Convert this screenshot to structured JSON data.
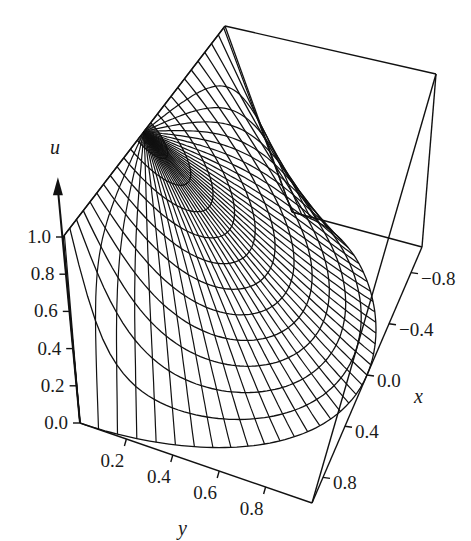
{
  "chart_data": {
    "type": "surface-wireframe",
    "title": "",
    "function": "u = (2/pi) * atan((1 - rho^2) / (2 * rho * sin(theta)))",
    "mesh": {
      "rho_rings": 12,
      "theta_rays": 40,
      "rho_max": 1.0
    },
    "axes": {
      "u": {
        "label": "u",
        "range": [
          0.0,
          1.0
        ],
        "ticks": [
          "0.0",
          "0.2",
          "0.4",
          "0.6",
          "0.8",
          "1.0"
        ]
      },
      "y": {
        "label": "y",
        "range": [
          0.0,
          1.0
        ],
        "ticks": [
          "0.2",
          "0.4",
          "0.6",
          "0.8"
        ]
      },
      "x": {
        "label": "x",
        "range": [
          -1.0,
          1.0
        ],
        "ticks": [
          "−0.8",
          "−0.4",
          "0.0",
          "0.4",
          "0.8"
        ]
      }
    },
    "line_color": "#111111",
    "background": "#ffffff"
  },
  "projection": {
    "comment": "screen coords of bounding box corners, keyed by (x,y,u)",
    "A_x1_y0_u0": [
      80,
      423
    ],
    "B_x1_y1_u0": [
      312,
      503
    ],
    "C_xm1_y1_u0": [
      422,
      247
    ],
    "G_xm1_y0_u0": [
      292,
      212
    ],
    "D_x1_y0_u1": [
      63,
      237
    ],
    "H_x1_y1_u1": [
      298,
      330
    ],
    "F_xm1_y1_u1": [
      436,
      74
    ],
    "E_xm1_y0_u1": [
      225,
      26
    ]
  },
  "labels": {
    "u_axis": "u",
    "y_axis": "y",
    "x_axis": "x"
  }
}
